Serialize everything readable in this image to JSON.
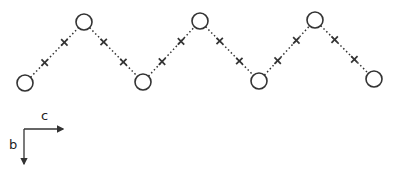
{
  "diagram": {
    "type": "zigzag-chain",
    "stroke_color": "#333333",
    "background": "#ffffff",
    "nodes": [
      {
        "id": 1,
        "x": 25,
        "y": 83,
        "r": 8
      },
      {
        "id": 2,
        "x": 84,
        "y": 22,
        "r": 8
      },
      {
        "id": 3,
        "x": 143,
        "y": 82,
        "r": 8
      },
      {
        "id": 4,
        "x": 200,
        "y": 21,
        "r": 8
      },
      {
        "id": 5,
        "x": 259,
        "y": 81,
        "r": 8
      },
      {
        "id": 6,
        "x": 315,
        "y": 20,
        "r": 8
      },
      {
        "id": 7,
        "x": 374,
        "y": 79,
        "r": 8
      }
    ],
    "bond_style": "dotted",
    "markers_per_bond": 2,
    "marker_glyph": "x"
  },
  "axes": {
    "horizontal_label": "c",
    "vertical_label": "b",
    "origin": {
      "x": 24,
      "y": 129
    },
    "horizontal_end": {
      "x": 63,
      "y": 129
    },
    "vertical_end": {
      "x": 24,
      "y": 164
    }
  }
}
